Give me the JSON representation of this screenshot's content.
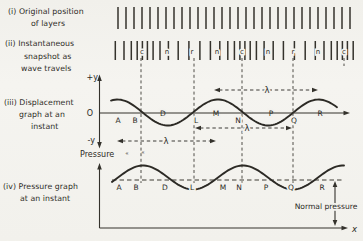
{
  "canvas": {
    "width": 363,
    "height": 241,
    "paper": "#f3f2ee",
    "ink": "#2f2d28"
  },
  "labels": {
    "i": {
      "lines": [
        "(i) Original position",
        "of layers"
      ]
    },
    "ii": {
      "lines": [
        "(ii) Instantaneous",
        "snapshot as",
        "wave travels"
      ]
    },
    "iii": {
      "lines": [
        "(iii) Displacement",
        "graph at an",
        "instant"
      ]
    },
    "iv": {
      "lines": [
        "(iv) Pressure graph",
        "at an instant"
      ]
    }
  },
  "texts": {
    "plus_y": "+y",
    "minus_y": "-y",
    "origin": "O",
    "pressure_axis": "Pressure",
    "x_axis": "x",
    "normal_pressure": "Normal pressure",
    "lambda": "λ",
    "stray_marks": [
      "«",
      "«"
    ]
  },
  "layers_row1": {
    "y1": 7,
    "y2": 29,
    "tick_xs": [
      118,
      126,
      134,
      142,
      150,
      158,
      166,
      174,
      182,
      190,
      198,
      206,
      214,
      222,
      230,
      238,
      246,
      254,
      262,
      270,
      278,
      286,
      294,
      302,
      310,
      318,
      326,
      334,
      342,
      350
    ]
  },
  "layers_row2": {
    "y1": 41,
    "y2": 60,
    "marker_baseline": 54,
    "tick_xs": [
      115.3,
      124,
      131.3,
      137.2,
      142.4,
      147.4,
      153.1,
      160,
      168.4,
      178.2,
      188.9,
      199.9,
      210.4,
      219.8,
      227.8,
      234.4,
      239.9,
      244.9,
      250.2,
      256.4,
      264.1,
      273.2,
      283.4,
      294.4,
      305.2,
      315.3,
      324,
      331.3,
      337.2,
      342.4,
      347.4,
      353.2
    ],
    "markers": [
      {
        "x": 142,
        "label": "c"
      },
      {
        "x": 167,
        "label": "n"
      },
      {
        "x": 192,
        "label": "r"
      },
      {
        "x": 217,
        "label": "n"
      },
      {
        "x": 242,
        "label": "c"
      },
      {
        "x": 268,
        "label": "n"
      },
      {
        "x": 293,
        "label": "r"
      },
      {
        "x": 318,
        "label": "n"
      },
      {
        "x": 344,
        "label": "c"
      }
    ]
  },
  "guides": {
    "dashed_vertical_xs": [
      141,
      194,
      242,
      293
    ],
    "y1": 58,
    "y2": 183,
    "short_dash": {
      "x": 344,
      "y1": 58,
      "y2": 66
    }
  },
  "displacement_graph": {
    "curve": {
      "crest_x": 117.5,
      "center_y": 112.5,
      "amplitude": 13,
      "wavelength": 100.5,
      "x_start": 111,
      "x_end": 338
    },
    "axis_y": 113,
    "letters_below": [
      {
        "x": 118,
        "label": "A"
      },
      {
        "x": 135,
        "label": "B"
      },
      {
        "x": 196,
        "label": "L"
      },
      {
        "x": 238,
        "label": "N"
      },
      {
        "x": 294,
        "label": "Q"
      }
    ],
    "letters_below_baseline": 123,
    "letters_on_axis": [
      {
        "x": 163,
        "label": "D"
      },
      {
        "x": 216,
        "label": "M"
      },
      {
        "x": 271,
        "label": "P"
      },
      {
        "x": 320,
        "label": "R"
      }
    ],
    "letters_axis_baseline": 116,
    "lambda_arrows": [
      {
        "x1": 117,
        "x2": 216,
        "y": 141,
        "label_x": 166
      },
      {
        "x1": 195,
        "x2": 292,
        "y": 128,
        "label_x": 247
      },
      {
        "x1": 214,
        "x2": 318,
        "y": 90,
        "label_x": 267
      }
    ]
  },
  "pressure_graph": {
    "curve": {
      "crest_x": 143,
      "center_y": 177.5,
      "amplitude": 12,
      "wavelength": 100,
      "x_start": 112,
      "x_end": 344
    },
    "normal_line": {
      "y": 180,
      "x1": 112,
      "x2": 343
    },
    "letters": [
      {
        "x": 119,
        "label": "A"
      },
      {
        "x": 136,
        "label": "B"
      },
      {
        "x": 165,
        "label": "D"
      },
      {
        "x": 192,
        "label": "L"
      },
      {
        "x": 223,
        "label": "M"
      },
      {
        "x": 239,
        "label": "N"
      },
      {
        "x": 266,
        "label": "P"
      },
      {
        "x": 291,
        "label": "Q"
      },
      {
        "x": 322,
        "label": "R"
      }
    ],
    "letters_baseline": 190,
    "normal_arrow": {
      "x": 335,
      "y1": 181,
      "y2": 226
    }
  },
  "wave_model": {
    "description": "longitudinal wave: compressions at c, rarefactions at r, normal spacing at n",
    "wavelength_px": 100,
    "compression_xs": [
      142,
      242,
      344
    ],
    "rarefaction_xs": [
      192,
      293
    ],
    "normal_xs": [
      167,
      217,
      268,
      318
    ]
  }
}
